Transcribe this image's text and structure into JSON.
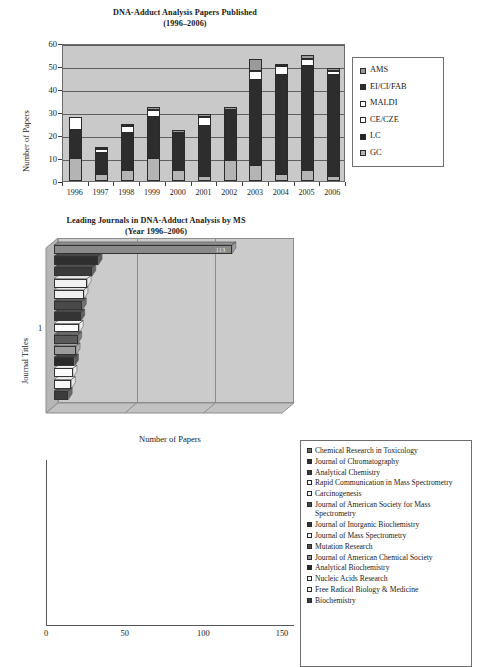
{
  "chart_data": [
    {
      "type": "bar",
      "id": "dna-adduct-papers-published",
      "title": "DNA-Adduct Analysis Papers Published",
      "subtitle": "(1996–2006)",
      "xlabel": "",
      "ylabel": "Number of Papers",
      "categories": [
        "1996",
        "1997",
        "1998",
        "1999",
        "2000",
        "2001",
        "2002",
        "2003",
        "2004",
        "2005",
        "2006"
      ],
      "ylim": [
        0,
        60
      ],
      "yticks": [
        0,
        10,
        20,
        30,
        40,
        50,
        60
      ],
      "grid": true,
      "stacked": true,
      "legend_position": "right",
      "series": [
        {
          "name": "GC",
          "color": "#a8a8a8",
          "values": [
            10,
            3,
            5,
            10,
            5,
            2,
            9,
            7,
            3,
            5,
            2
          ]
        },
        {
          "name": "LC",
          "color": "#2d2d2d",
          "values": [
            0,
            0,
            0,
            0,
            0,
            0,
            0,
            0,
            0,
            0,
            0
          ]
        },
        {
          "name": "CE/CZE",
          "color": "#ffffff",
          "values": [
            0,
            0,
            0,
            0,
            0,
            0,
            0,
            0,
            0,
            0,
            0
          ]
        },
        {
          "name": "MALDI",
          "color": "#ffffff",
          "values": [
            0,
            0,
            0,
            0,
            0,
            0,
            0,
            0,
            0,
            0,
            0
          ]
        },
        {
          "name": "EI/CI/FAB",
          "color": "#2d2d2d",
          "values": [
            12,
            9,
            16,
            18,
            16,
            22,
            22,
            37,
            43,
            45,
            44
          ]
        },
        {
          "name": "AMS",
          "color": "#9a9a9a",
          "values": [
            0,
            0,
            0,
            0,
            0,
            0,
            0,
            0,
            0,
            0,
            0
          ]
        }
      ],
      "stack_detail": [
        {
          "category": "1996",
          "total": 28,
          "segments": [
            {
              "name": "GC",
              "value": 10
            },
            {
              "name": "EI/CI/FAB",
              "value": 12
            },
            {
              "name": "MALDI",
              "value": 6
            }
          ]
        },
        {
          "category": "1997",
          "total": 15,
          "segments": [
            {
              "name": "GC",
              "value": 3
            },
            {
              "name": "EI/CI/FAB",
              "value": 9
            },
            {
              "name": "MALDI",
              "value": 2
            },
            {
              "name": "AMS",
              "value": 1
            }
          ]
        },
        {
          "category": "1998",
          "total": 25,
          "segments": [
            {
              "name": "GC",
              "value": 5
            },
            {
              "name": "EI/CI/FAB",
              "value": 16
            },
            {
              "name": "MALDI",
              "value": 3
            },
            {
              "name": "AMS",
              "value": 1
            }
          ]
        },
        {
          "category": "1999",
          "total": 32,
          "segments": [
            {
              "name": "GC",
              "value": 10
            },
            {
              "name": "EI/CI/FAB",
              "value": 18
            },
            {
              "name": "MALDI",
              "value": 3
            },
            {
              "name": "AMS",
              "value": 1
            }
          ]
        },
        {
          "category": "2000",
          "total": 22,
          "segments": [
            {
              "name": "GC",
              "value": 5
            },
            {
              "name": "EI/CI/FAB",
              "value": 16
            },
            {
              "name": "AMS",
              "value": 1
            }
          ]
        },
        {
          "category": "2001",
          "total": 29,
          "segments": [
            {
              "name": "GC",
              "value": 2
            },
            {
              "name": "EI/CI/FAB",
              "value": 22
            },
            {
              "name": "MALDI",
              "value": 4
            },
            {
              "name": "AMS",
              "value": 1
            }
          ]
        },
        {
          "category": "2002",
          "total": 32,
          "segments": [
            {
              "name": "GC",
              "value": 9
            },
            {
              "name": "EI/CI/FAB",
              "value": 22
            },
            {
              "name": "AMS",
              "value": 1
            }
          ]
        },
        {
          "category": "2003",
          "total": 53,
          "segments": [
            {
              "name": "GC",
              "value": 7
            },
            {
              "name": "EI/CI/FAB",
              "value": 37
            },
            {
              "name": "MALDI",
              "value": 4
            },
            {
              "name": "AMS",
              "value": 5
            }
          ]
        },
        {
          "category": "2004",
          "total": 51,
          "segments": [
            {
              "name": "GC",
              "value": 3
            },
            {
              "name": "EI/CI/FAB",
              "value": 43
            },
            {
              "name": "MALDI",
              "value": 4
            },
            {
              "name": "AMS",
              "value": 1
            }
          ]
        },
        {
          "category": "2005",
          "total": 55,
          "segments": [
            {
              "name": "GC",
              "value": 5
            },
            {
              "name": "EI/CI/FAB",
              "value": 45
            },
            {
              "name": "MALDI",
              "value": 3
            },
            {
              "name": "AMS",
              "value": 2
            }
          ]
        },
        {
          "category": "2006",
          "total": 49,
          "segments": [
            {
              "name": "GC",
              "value": 2
            },
            {
              "name": "EI/CI/FAB",
              "value": 44
            },
            {
              "name": "MALDI",
              "value": 2
            },
            {
              "name": "AMS",
              "value": 1
            }
          ]
        }
      ]
    },
    {
      "type": "bar",
      "id": "leading-journals",
      "orientation": "horizontal",
      "title": "Leading Journals in DNA-Adduct Analysis by MS",
      "subtitle": "(Year 1996–2006)",
      "xlabel": "Number of Papers",
      "ylabel": "Journal Titles",
      "xlim": [
        0,
        150
      ],
      "xticks": [
        0,
        50,
        100,
        150
      ],
      "yticks": [
        "1"
      ],
      "grid": true,
      "legend_position": "right",
      "bar_value_label": "113",
      "categories": [
        "Chemical Research in Toxicology",
        "Journal of Chromatography",
        "Analytical Chemistry",
        "Rapid Communication in Mass Spectrometry",
        "Carcinogenesis",
        "Journal of American Society for Mass Spectrometry",
        "Journal of Inorganic Biochemistry",
        "Journal of Mass Spectrometry",
        "Mutation Research",
        "Journal of American Chemical Society",
        "Analytical Biochemistry",
        "Nucleic Acids Research",
        "Free Radical Biology & Medicine",
        "Biochemistry"
      ],
      "values": [
        113,
        28,
        24,
        21,
        19,
        18,
        17,
        16,
        15,
        14,
        13,
        12,
        11,
        9
      ],
      "colors": [
        "#8a8a8a",
        "#2f2f2f",
        "#3a3a3a",
        "#f2f2f2",
        "#efefef",
        "#4a4a4a",
        "#343434",
        "#fafafa",
        "#5a5a5a",
        "#9c9c9c",
        "#2b2b2b",
        "#fbfbfb",
        "#f7f7f7",
        "#3c3c3c"
      ]
    }
  ],
  "top_chart": {
    "title_line1": "DNA-Adduct Analysis Papers Published",
    "title_line2": "(1996–2006)",
    "ylabel": "Number of Papers",
    "yticks": [
      "60",
      "50",
      "40",
      "30",
      "20",
      "10",
      "0"
    ],
    "xticks": [
      "1996",
      "1997",
      "1998",
      "1999",
      "2000",
      "2001",
      "2002",
      "2003",
      "2004",
      "2005",
      "2006"
    ],
    "legend": [
      {
        "label": "AMS",
        "color": "#9a9a9a"
      },
      {
        "label": "EI/CI/FAB",
        "color": "#2d2d2d"
      },
      {
        "label": "MALDI",
        "color": "#ffffff"
      },
      {
        "label": "CE/CZE",
        "color": "#ffffff"
      },
      {
        "label": "LC",
        "color": "#222222"
      },
      {
        "label": "GC",
        "color": "#b4b4b4"
      }
    ]
  },
  "bottom_chart": {
    "title_line1": "Leading Journals in DNA-Adduct Analysis by MS",
    "title_line2": "(Year 1996–2006)",
    "ylabel": "Journal Titles",
    "xlabel": "Number of Papers",
    "xticks": [
      "0",
      "50",
      "100",
      "150"
    ],
    "ytick": "1",
    "legend": [
      {
        "label": "Chemical Research in Toxicology",
        "color": "#6e6e6e"
      },
      {
        "label": "Journal of Chromatography",
        "color": "#2f2f2f"
      },
      {
        "label": "Analytical Chemistry",
        "color": "#3a3a3a"
      },
      {
        "label": "Rapid Communication in Mass Spectrometry",
        "color": "#f4f4f4"
      },
      {
        "label": "Carcinogenesis",
        "color": "#f4f4f4"
      },
      {
        "label": "Journal of American Society for Mass Spectrometry",
        "color": "#4a4a4a"
      },
      {
        "label": "Journal of Inorganic Biochemistry",
        "color": "#343434"
      },
      {
        "label": "Journal of Mass Spectrometry",
        "color": "#fafafa"
      },
      {
        "label": "Mutation Research",
        "color": "#4f4f4f"
      },
      {
        "label": "Journal of American Chemical Society",
        "color": "#8f8f8f"
      },
      {
        "label": "Analytical Biochemistry",
        "color": "#2b2b2b"
      },
      {
        "label": "Nucleic Acids Research",
        "color": "#fbfbfb"
      },
      {
        "label": "Free Radical Biology & Medicine",
        "color": "#f7f7f7"
      },
      {
        "label": "Biochemistry",
        "color": "#3c3c3c"
      }
    ]
  }
}
